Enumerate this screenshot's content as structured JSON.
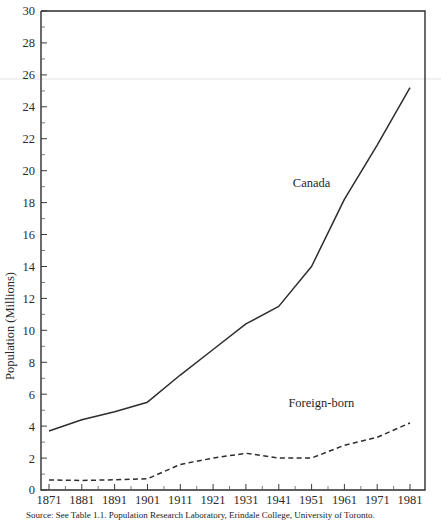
{
  "chart_data": {
    "type": "line",
    "title": "",
    "xlabel": "",
    "ylabel": "Population (Millions)",
    "xlim": [
      1871,
      1981
    ],
    "ylim": [
      0,
      30
    ],
    "ytick_step": 2,
    "xtick_step": 10,
    "grid": false,
    "legend": "inline-annotations",
    "x": [
      1871,
      1881,
      1891,
      1901,
      1911,
      1921,
      1931,
      1941,
      1951,
      1961,
      1971,
      1981
    ],
    "xticklabels": [
      "1871",
      "1881",
      "1891",
      "1901",
      "1911",
      "1921",
      "1931",
      "1941",
      "1951",
      "1961",
      "1971",
      "1981"
    ],
    "yticklabels": [
      "0",
      "2",
      "4",
      "6",
      "8",
      "10",
      "12",
      "14",
      "16",
      "18",
      "20",
      "22",
      "24",
      "26",
      "28",
      "30"
    ],
    "series": [
      {
        "name": "Canada",
        "style": "solid",
        "color": "#2d2d2d",
        "label_x": 1951,
        "label_y": 19.0,
        "values": [
          3.7,
          4.4,
          4.9,
          5.5,
          7.2,
          8.8,
          10.4,
          11.5,
          14.0,
          18.2,
          21.6,
          25.2
        ]
      },
      {
        "name": "Foreign-born",
        "style": "dashed",
        "color": "#2d2d2d",
        "label_x": 1954,
        "label_y": 5.2,
        "values": [
          0.63,
          0.6,
          0.64,
          0.7,
          1.6,
          2.0,
          2.3,
          2.0,
          2.0,
          2.8,
          3.3,
          4.2
        ]
      }
    ]
  },
  "axes": {
    "ylabel": "Population (Millions)",
    "yticks": [
      "0",
      "2",
      "4",
      "6",
      "8",
      "10",
      "12",
      "14",
      "16",
      "18",
      "20",
      "22",
      "24",
      "26",
      "28",
      "30"
    ],
    "xticks": [
      "1871",
      "1881",
      "1891",
      "1901",
      "1911",
      "1921",
      "1931",
      "1941",
      "1951",
      "1961",
      "1971",
      "1981"
    ]
  },
  "annotations": {
    "canada_label": "Canada",
    "foreign_born_label": "Foreign-born"
  },
  "caption": {
    "text": "Source: See Table 1.1. Population Research Laboratory, Erindale College, University of Toronto."
  }
}
